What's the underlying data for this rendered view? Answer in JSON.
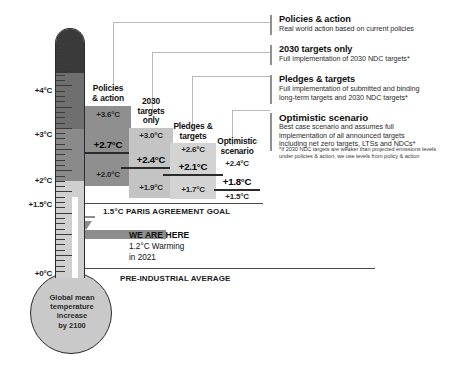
{
  "chart_data": {
    "type": "bar",
    "title": "Global mean temperature increase by 2100",
    "ylabel": "Temperature increase (°C above pre-industrial)",
    "ylim": [
      0,
      4.6
    ],
    "yticks": [
      "+0°C",
      "+1.5°C",
      "+2°C",
      "+3°C",
      "+4°C"
    ],
    "ytick_values": [
      0,
      1.5,
      2,
      3,
      4
    ],
    "grid": false,
    "categories": [
      "Policies & action",
      "2030 targets only",
      "Pledges & targets",
      "Optimistic scenario"
    ],
    "series": [
      {
        "name": "upper bound",
        "values": [
          3.6,
          3.0,
          2.6,
          2.4
        ]
      },
      {
        "name": "central estimate",
        "values": [
          2.7,
          2.4,
          2.1,
          1.8
        ]
      },
      {
        "name": "lower bound",
        "values": [
          2.0,
          1.9,
          1.7,
          1.5
        ]
      }
    ],
    "annotations": [
      {
        "label": "1.5°C PARIS AGREEMENT GOAL",
        "value": 1.5
      },
      {
        "label": "PRE-INDUSTRIAL AVERAGE",
        "value": 0
      },
      {
        "label": "WE ARE HERE",
        "value": 1.2,
        "detail": "1.2°C Warming in 2021"
      }
    ]
  },
  "thermometer": {
    "bulb_label": "Global mean\ntemperature\nincrease\nby 2100",
    "bulb_line_1": "Global mean",
    "bulb_line_2": "temperature",
    "bulb_line_3": "increase",
    "bulb_line_4": "by 2100",
    "axis": [
      {
        "label": "+4°C",
        "value": 4
      },
      {
        "label": "+3°C",
        "value": 3
      },
      {
        "label": "+2°C",
        "value": 2
      },
      {
        "label": "+1.5°C",
        "value": 1.5
      },
      {
        "label": "+0°C",
        "value": 0
      }
    ]
  },
  "columns": [
    {
      "id": "policies-action",
      "title_line_1": "Policies",
      "title_line_2": "& action",
      "high": "+3.6°C",
      "main": "+2.7°C",
      "low": "+2.0°C",
      "bar_color": "#8f8f8f"
    },
    {
      "id": "targets-2030",
      "title_line_1": "2030",
      "title_line_2": "targets",
      "title_line_3": "only",
      "high": "+3.0°C",
      "main": "+2.4°C",
      "low": "+1.9°C",
      "bar_color": "#c4c4c4"
    },
    {
      "id": "pledges-targets",
      "title_line_1": "Pledges &",
      "title_line_2": "targets",
      "high": "+2.6°C",
      "main": "+2.1°C",
      "low": "+1.7°C",
      "bar_color": "#d3d3d3"
    },
    {
      "id": "optimistic-scenario",
      "title_line_1": "Optimistic",
      "title_line_2": "scenario",
      "high": "+2.4°C",
      "main": "+1.8°C",
      "low": "+1.5°C",
      "bar_color": "none"
    }
  ],
  "reference_lines": {
    "paris_goal": "1.5°C PARIS AGREEMENT GOAL",
    "pre_industrial": "PRE-INDUSTRIAL AVERAGE"
  },
  "we_are_here": {
    "title": "WE ARE HERE",
    "line_1": "1.2°C Warming",
    "line_2": "in 2021"
  },
  "legend": {
    "items": [
      {
        "heading": "Policies & action",
        "lines": [
          "Real world action based on current policies"
        ]
      },
      {
        "heading": "2030 targets only",
        "lines": [
          "Full implementation of 2030 NDC targets*"
        ]
      },
      {
        "heading": "Pledges & targets",
        "lines": [
          "Full implementation of submitted and binding",
          "long-term targets and 2030 NDC targets*"
        ]
      },
      {
        "heading": "Optimistic scenario",
        "lines": [
          "Best case scenario and assumes full",
          "implementation of all announced targets",
          "including net zero targets, LTSs and NDCs*"
        ]
      }
    ],
    "footnote_line_1": "*If 2030 NDC targets are weaker than projected emissions levels",
    "footnote_line_2": "under policies & action, we use levels from policy & action"
  },
  "colors": {
    "outline": "#2b2b2b",
    "thermo_hot": "#3a3a3a",
    "thermo_warm": "#6f6f6f",
    "thermo_mid": "#8a8a8a",
    "thermo_cool": "#cfcfcf",
    "bulb": "#c9c9c9",
    "arrow": "#8d8d8d",
    "connector": "#b9b9b9"
  }
}
